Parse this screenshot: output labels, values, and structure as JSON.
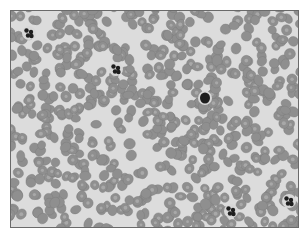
{
  "image": {
    "subject": "blood smear micrograph",
    "colors": {
      "background": "#ffffff",
      "plasma": "#dcdcdc",
      "rbc_fill": "#8f8f8f",
      "rbc_center": "#a8a8a8",
      "nucleus": "#1e1e1e",
      "border": "#6a6a6a"
    },
    "leukocytes": [
      {
        "x": 18,
        "y": 22,
        "shape": "lobed"
      },
      {
        "x": 105,
        "y": 58,
        "shape": "lobed"
      },
      {
        "x": 194,
        "y": 87,
        "shape": "round"
      },
      {
        "x": 220,
        "y": 200,
        "shape": "lobed"
      },
      {
        "x": 278,
        "y": 190,
        "shape": "lobed"
      }
    ]
  }
}
